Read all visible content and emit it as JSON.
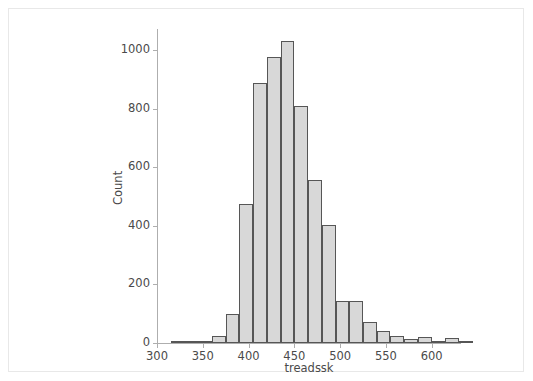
{
  "chart_data": {
    "type": "bar",
    "subtype": "histogram",
    "title": "",
    "subtitle": "",
    "xlabel": "treadssk",
    "ylabel": "Count",
    "xlim": [
      300,
      632
    ],
    "ylim": [
      0,
      1072
    ],
    "xticks": [
      300,
      350,
      400,
      450,
      500,
      550,
      600
    ],
    "yticks": [
      0,
      200,
      400,
      600,
      800,
      1000
    ],
    "xtick_labels": [
      "300",
      "350",
      "400",
      "450",
      "500",
      "550",
      "600"
    ],
    "ytick_labels": [
      "0",
      "200",
      "400",
      "600",
      "800",
      "1000"
    ],
    "grid": false,
    "legend": null,
    "bin_width": 15,
    "bar_fill_color": "#d8d8d8",
    "bar_edge_color": "#565656",
    "axis_color": "#aeaeae",
    "text_color": "#4a4a4a",
    "frame_color": "#e8e8e8",
    "background_color": "#ffffff",
    "bins": [
      {
        "start": 315,
        "end": 330,
        "count": 1
      },
      {
        "start": 330,
        "end": 345,
        "count": 3
      },
      {
        "start": 345,
        "end": 360,
        "count": 8
      },
      {
        "start": 360,
        "end": 375,
        "count": 25
      },
      {
        "start": 375,
        "end": 390,
        "count": 100
      },
      {
        "start": 390,
        "end": 405,
        "count": 473
      },
      {
        "start": 405,
        "end": 420,
        "count": 888
      },
      {
        "start": 420,
        "end": 435,
        "count": 975
      },
      {
        "start": 435,
        "end": 450,
        "count": 1030
      },
      {
        "start": 450,
        "end": 465,
        "count": 808
      },
      {
        "start": 465,
        "end": 480,
        "count": 558
      },
      {
        "start": 480,
        "end": 495,
        "count": 403
      },
      {
        "start": 495,
        "end": 510,
        "count": 145
      },
      {
        "start": 510,
        "end": 525,
        "count": 143
      },
      {
        "start": 525,
        "end": 540,
        "count": 72
      },
      {
        "start": 540,
        "end": 555,
        "count": 40
      },
      {
        "start": 555,
        "end": 570,
        "count": 25
      },
      {
        "start": 570,
        "end": 585,
        "count": 15
      },
      {
        "start": 585,
        "end": 600,
        "count": 22
      },
      {
        "start": 600,
        "end": 615,
        "count": 4
      },
      {
        "start": 615,
        "end": 630,
        "count": 18
      },
      {
        "start": 630,
        "end": 645,
        "count": 6
      }
    ]
  }
}
